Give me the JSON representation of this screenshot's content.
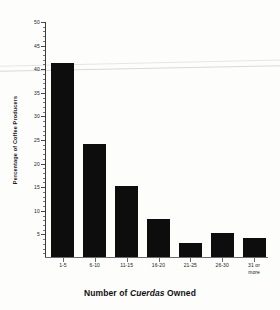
{
  "chart_data": {
    "type": "bar",
    "title": "",
    "xlabel": "Number of Cuerdas Owned",
    "xlabel_italic_word": "Cuerdas",
    "ylabel": "Percentage of Coffee Producers",
    "categories": [
      "1-5",
      "6-10",
      "11-15",
      "16-20",
      "21-25",
      "26-30",
      "31 or more"
    ],
    "category_lines": [
      [
        "1-5"
      ],
      [
        "6-10"
      ],
      [
        "11-15"
      ],
      [
        "16-20"
      ],
      [
        "21-25"
      ],
      [
        "26-30"
      ],
      [
        "31 or",
        "more"
      ]
    ],
    "values": [
      41,
      24,
      15,
      8,
      3,
      5,
      4
    ],
    "ylim": [
      0,
      50
    ],
    "ytick_labels": [
      "5",
      "10",
      "15",
      "20",
      "25",
      "30",
      "35",
      "40",
      "45",
      "50"
    ],
    "ytick_values": [
      5,
      10,
      15,
      20,
      25,
      30,
      35,
      40,
      45,
      50
    ],
    "ytick_minor_step": 1,
    "grid": false,
    "legend": "none",
    "bar_color": "#0d0d0d",
    "axis_color": "#3a3a3a",
    "background": "#ffffff"
  }
}
